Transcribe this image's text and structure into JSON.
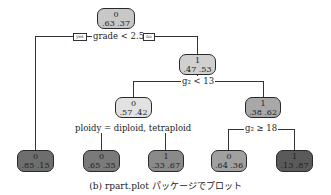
{
  "tree": {
    "nodes": {
      "root": {
        "class": "0",
        "probs": ".63 .37",
        "fill": "#c8c8c8"
      },
      "n_right": {
        "class": "1",
        "probs": ".47 .53",
        "fill": "#d0d0d0"
      },
      "n_mid": {
        "class": "0",
        "probs": ".57 .42",
        "fill": "#e0e0e0"
      },
      "n_rr": {
        "class": "1",
        "probs": ".38 .62",
        "fill": "#a8a8a8"
      },
      "leaf1": {
        "class": "0",
        "probs": ".85 .15",
        "fill": "#6e6e6e"
      },
      "leaf2": {
        "class": "0",
        "probs": ".65 .35",
        "fill": "#7a7a7a"
      },
      "leaf3": {
        "class": "1",
        "probs": ".33 .67",
        "fill": "#8a8a8a"
      },
      "leaf4": {
        "class": "0",
        "probs": ".64 .36",
        "fill": "#a0a0a0"
      },
      "leaf5": {
        "class": "1",
        "probs": ".13 .87",
        "fill": "#5a5a5a"
      }
    },
    "splits": {
      "root": "grade < 2.5",
      "n_right": "g₂ < 13",
      "n_mid": "ploidy = diploid, tetraploid",
      "n_rr": "g₂ ≥ 18"
    },
    "yes_label": "yes",
    "no_label": "no"
  },
  "caption": "(b)  rpart.plot パッケージでプロット"
}
